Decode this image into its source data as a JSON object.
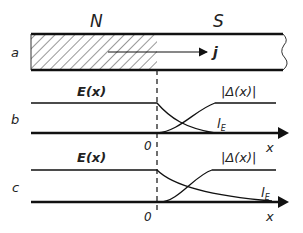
{
  "panel_a": {
    "label": "a",
    "normal_label": "N",
    "super_label": "S",
    "current_label": "j"
  },
  "panel_b": {
    "label": "b",
    "e_label": "E(x)",
    "delta_label": "|Δ(x)|",
    "length_label": "l",
    "length_sub": "E",
    "origin_label": "0",
    "axis_label": "x"
  },
  "panel_c": {
    "label": "c",
    "e_label": "E(x)",
    "delta_label": "|Δ(x)|",
    "length_label": "l",
    "length_sub": "E",
    "origin_label": "0",
    "axis_label": "x"
  }
}
